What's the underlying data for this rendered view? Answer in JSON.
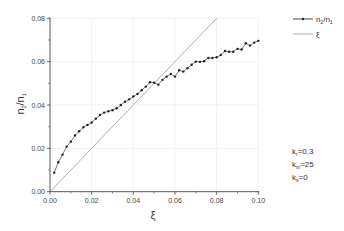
{
  "chart_data": {
    "type": "line",
    "title": "",
    "xlabel": "ξ",
    "ylabel": "n2/n1",
    "xlim": [
      0.0,
      0.1
    ],
    "ylim": [
      0.0,
      0.08
    ],
    "x_ticks": [
      "0.00",
      "0.02",
      "0.04",
      "0.06",
      "0.08",
      "0.10"
    ],
    "y_ticks": [
      "0.00",
      "0.02",
      "0.04",
      "0.06",
      "0.08"
    ],
    "grid": true,
    "legend_position": "top-right",
    "series": [
      {
        "name": "n2/n1",
        "style": "line-with-markers",
        "color": "#222222",
        "x": [
          0.002,
          0.004,
          0.006,
          0.008,
          0.01,
          0.012,
          0.014,
          0.016,
          0.018,
          0.02,
          0.022,
          0.024,
          0.026,
          0.028,
          0.03,
          0.032,
          0.034,
          0.036,
          0.038,
          0.04,
          0.042,
          0.044,
          0.046,
          0.048,
          0.05,
          0.052,
          0.054,
          0.056,
          0.058,
          0.06,
          0.062,
          0.064,
          0.066,
          0.068,
          0.07,
          0.072,
          0.074,
          0.076,
          0.078,
          0.08,
          0.082,
          0.084,
          0.086,
          0.088,
          0.09,
          0.092,
          0.094,
          0.096,
          0.098,
          0.1
        ],
        "values": [
          0.0088,
          0.0136,
          0.0171,
          0.0208,
          0.0231,
          0.0259,
          0.0279,
          0.0297,
          0.0308,
          0.0319,
          0.0337,
          0.0354,
          0.0365,
          0.0371,
          0.0376,
          0.0385,
          0.04,
          0.0415,
          0.0426,
          0.0439,
          0.0451,
          0.0468,
          0.0485,
          0.0505,
          0.0503,
          0.0494,
          0.0516,
          0.0531,
          0.0543,
          0.0531,
          0.056,
          0.0554,
          0.057,
          0.0586,
          0.06,
          0.0599,
          0.0602,
          0.0617,
          0.0617,
          0.062,
          0.0631,
          0.0649,
          0.0646,
          0.0646,
          0.0659,
          0.0656,
          0.0685,
          0.0674,
          0.0688,
          0.0696
        ]
      },
      {
        "name": "ξ",
        "style": "line",
        "color": "#999999",
        "x": [
          0.0,
          0.08
        ],
        "values": [
          0.0,
          0.08
        ]
      }
    ],
    "annotations": [
      {
        "base": "k",
        "sub": "r",
        "rest": "=0.3"
      },
      {
        "base": "k",
        "sub": "m",
        "rest": "=25"
      },
      {
        "base": "k",
        "sub": "s",
        "rest": "=0"
      }
    ]
  },
  "labels": {
    "ylabel_main": "n",
    "ylabel_sub1": "2",
    "ylabel_slash": "/n",
    "ylabel_sub2": "1",
    "xlabel": "ξ",
    "legend_series1_main": "n",
    "legend_series1_sub1": "2",
    "legend_series1_slash": "/n",
    "legend_series1_sub2": "1",
    "legend_series2": "ξ"
  }
}
